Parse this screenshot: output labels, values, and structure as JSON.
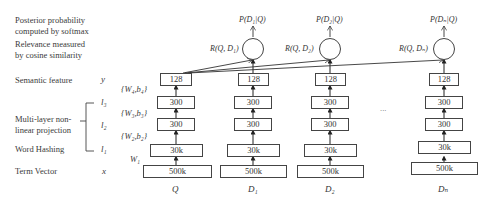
{
  "left_labels": {
    "posterior": [
      "Posterior probability",
      "computed by softmax"
    ],
    "relevance": [
      "Relevance measured",
      "by cosine similarity"
    ],
    "semantic": "Semantic feature",
    "multilayer": [
      "Multi-layer non-",
      "linear projection"
    ],
    "hashing": "Word Hashing",
    "term": "Term Vector"
  },
  "layer_vars": {
    "y": "y",
    "l3": "l₃",
    "l2": "l₂",
    "l1": "l₁",
    "x": "x"
  },
  "weights": {
    "w4": "{W₄,b₄}",
    "w3": "{W₃,b₃}",
    "w2": "{W₂,b₂}",
    "w1": "W₁"
  },
  "columns": [
    {
      "name": "Q",
      "layers": [
        "128",
        "300",
        "300",
        "30k",
        "500k"
      ]
    },
    {
      "name": "D₁",
      "layers": [
        "128",
        "300",
        "300",
        "30k",
        "500k"
      ],
      "relevance": "R(Q, D₁)",
      "posterior": "P(D₁|Q)"
    },
    {
      "name": "D₂",
      "layers": [
        "128",
        "300",
        "300",
        "30k",
        "500k"
      ],
      "relevance": "R(Q, D₂)",
      "posterior": "P(D₂|Q)"
    },
    {
      "name": "Dₙ",
      "layers": [
        "128",
        "300",
        "300",
        "30k",
        "500k"
      ],
      "relevance": "R(Q, Dₙ)",
      "posterior": "P(Dₙ|Q)"
    }
  ],
  "ellipsis": "..."
}
